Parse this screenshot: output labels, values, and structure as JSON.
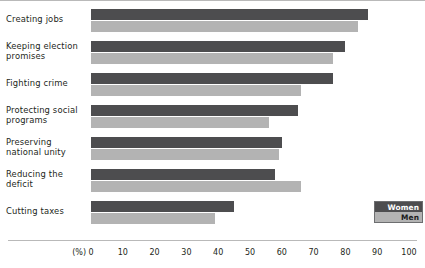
{
  "chart_data": {
    "type": "bar",
    "orientation": "horizontal",
    "title": "",
    "xlabel": "(%)",
    "ylabel": "",
    "xlim": [
      0,
      100
    ],
    "xticks": [
      "0",
      "10",
      "20",
      "30",
      "40",
      "50",
      "60",
      "70",
      "80",
      "90",
      "100"
    ],
    "grid": false,
    "legend_position": "bottom-right",
    "categories": [
      "Creating jobs",
      "Keeping election promises",
      "Fighting crime",
      "Protecting social programs",
      "Preserving national unity",
      "Reducing the deficit",
      "Cutting taxes"
    ],
    "series": [
      {
        "name": "Women",
        "color": "#4d4d4f",
        "values": [
          87,
          80,
          76,
          65,
          60,
          58,
          45
        ]
      },
      {
        "name": "Men",
        "color": "#b3b3b3",
        "values": [
          84,
          76,
          66,
          56,
          59,
          66,
          39
        ]
      }
    ]
  },
  "axis": {
    "unit_label": "(%)"
  },
  "legend": {
    "items": [
      {
        "label": "Women",
        "color": "#4d4d4f"
      },
      {
        "label": "Men",
        "color": "#b3b3b3"
      }
    ]
  },
  "category_label_lines": [
    [
      "Creating jobs"
    ],
    [
      "Keeping election",
      "promises"
    ],
    [
      "Fighting crime"
    ],
    [
      "Protecting social",
      "programs"
    ],
    [
      "Preserving",
      "national unity"
    ],
    [
      "Reducing the",
      "deficit"
    ],
    [
      "Cutting taxes"
    ]
  ]
}
